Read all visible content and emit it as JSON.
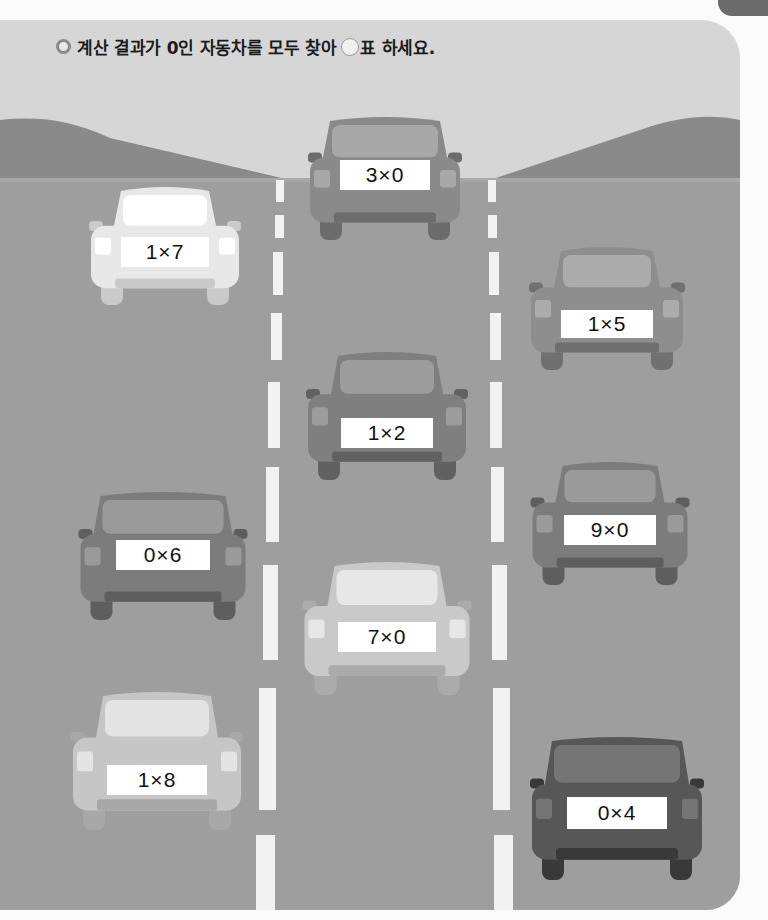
{
  "instruction": {
    "bullet_icon": "ring-bullet-icon",
    "text_before": "계산 결과가 0인 자동차를 모두 찾아",
    "circle_icon": "empty-circle-icon",
    "text_after": "표 하세요."
  },
  "colors": {
    "sky": "#d6d6d6",
    "hills": "#8a8a8a",
    "road": "#9e9e9e",
    "lane_mark": "#f2f2f2",
    "plate": "#ffffff",
    "corner_tab": "#6b6b6b"
  },
  "cars": [
    {
      "id": "car-3x0",
      "expression": "3×0",
      "lane": "center",
      "shade": "#8a8a8a"
    },
    {
      "id": "car-1x7",
      "expression": "1×7",
      "lane": "left",
      "shade": "#e8e8e8"
    },
    {
      "id": "car-1x5",
      "expression": "1×5",
      "lane": "right",
      "shade": "#8e8e8e"
    },
    {
      "id": "car-1x2",
      "expression": "1×2",
      "lane": "center",
      "shade": "#7f7f7f"
    },
    {
      "id": "car-9x0",
      "expression": "9×0",
      "lane": "right",
      "shade": "#7c7c7c"
    },
    {
      "id": "car-0x6",
      "expression": "0×6",
      "lane": "left",
      "shade": "#7c7c7c"
    },
    {
      "id": "car-7x0",
      "expression": "7×0",
      "lane": "center",
      "shade": "#c9c9c9"
    },
    {
      "id": "car-1x8",
      "expression": "1×8",
      "lane": "left",
      "shade": "#c6c6c6"
    },
    {
      "id": "car-0x4",
      "expression": "0×4",
      "lane": "right",
      "shade": "#575757"
    }
  ]
}
